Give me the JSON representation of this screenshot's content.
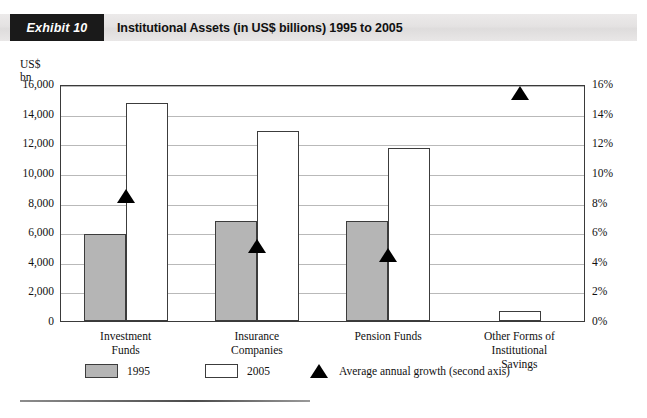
{
  "header": {
    "exhibit_label": "Exhibit 10",
    "title": "Institutional Assets (in US$ billions) 1995 to 2005",
    "band_color": "#e6e4e4",
    "tag_color": "#1a1a1a"
  },
  "chart_data": {
    "type": "bar",
    "title": "Institutional Assets (in US$ billions) 1995 to 2005",
    "xlabel": "",
    "ylabel": "US$ bn",
    "y2label": "",
    "ylim": [
      0,
      16000
    ],
    "y2lim": [
      0,
      16
    ],
    "yticks": [
      "0",
      "2,000",
      "4,000",
      "6,000",
      "8,000",
      "10,000",
      "12,000",
      "14,000",
      "16,000"
    ],
    "ytick_values": [
      0,
      2000,
      4000,
      6000,
      8000,
      10000,
      12000,
      14000,
      16000
    ],
    "y2ticks": [
      "0%",
      "2%",
      "4%",
      "6%",
      "8%",
      "10%",
      "12%",
      "14%",
      "16%"
    ],
    "y2tick_values": [
      0,
      2,
      4,
      6,
      8,
      10,
      12,
      14,
      16
    ],
    "grid": true,
    "legend_position": "below",
    "categories": [
      "Investment\nFunds",
      "Insurance\nCompanies",
      "Pension Funds",
      "Other Forms of\nInstitutional\nSavings"
    ],
    "category_lines": [
      [
        "Investment",
        "Funds"
      ],
      [
        "Insurance",
        "Companies"
      ],
      [
        "Pension Funds"
      ],
      [
        "Other Forms of",
        "Institutional",
        "Savings"
      ]
    ],
    "series": [
      {
        "name": "1995",
        "axis": "left",
        "color": "#b5b5b5",
        "values": [
          5900,
          6750,
          6750,
          0
        ]
      },
      {
        "name": "2005",
        "axis": "left",
        "color": "#ffffff",
        "values": [
          14750,
          12800,
          11700,
          700
        ]
      },
      {
        "name": "Average annual growth (second axis)",
        "axis": "right",
        "marker": "triangle",
        "color": "#000000",
        "values": [
          8.6,
          5.2,
          4.6,
          15.5
        ]
      }
    ]
  },
  "axes": {
    "left_title_line1": "US$",
    "left_title_line2": "bn"
  },
  "legend": {
    "items": [
      {
        "label": "1995",
        "swatch": "gray-rect"
      },
      {
        "label": "2005",
        "swatch": "white-rect"
      },
      {
        "label": "Average annual growth (second axis)",
        "swatch": "black-triangle"
      }
    ]
  }
}
